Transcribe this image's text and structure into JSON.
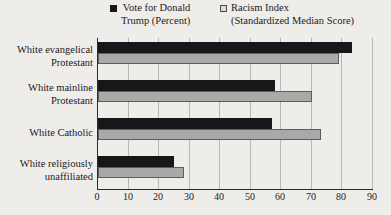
{
  "chart_data": {
    "type": "bar",
    "orientation": "horizontal",
    "title": "",
    "subtitle": "",
    "xlabel": "",
    "ylabel": "",
    "xlim": [
      0,
      90
    ],
    "xticks": [
      0,
      10,
      20,
      30,
      40,
      50,
      60,
      70,
      80,
      90
    ],
    "grid": true,
    "legend_position": "top",
    "categories": [
      "White evangelical\nProtestant",
      "White mainline\nProtestant",
      "White Catholic",
      "White religiously\nunaffiliated"
    ],
    "series": [
      {
        "name": "Vote for Donald\nTrump (Percent)",
        "color": "#17171a",
        "values": [
          83,
          58,
          57,
          25
        ]
      },
      {
        "name": "Racism Index\n(Standardized Median Score)",
        "color": "#a9a9a9",
        "values": [
          79,
          70,
          73,
          28
        ]
      }
    ]
  },
  "legend": {
    "entries": [
      {
        "label": "Vote for Donald\nTrump (Percent)",
        "swatch": "filled-square"
      },
      {
        "label": "Racism Index\n(Standardized Median Score)",
        "swatch": "open-square"
      }
    ]
  },
  "axis": {
    "tick_labels": [
      "0",
      "10",
      "20",
      "30",
      "40",
      "50",
      "60",
      "70",
      "80",
      "90"
    ]
  },
  "colors": {
    "background": "#efedea",
    "series_black": "#17171a",
    "series_gray": "#a9a9a9",
    "gridline": "#b9b7b3",
    "axis": "#2b2b2b",
    "text": "#1a1a1a"
  }
}
